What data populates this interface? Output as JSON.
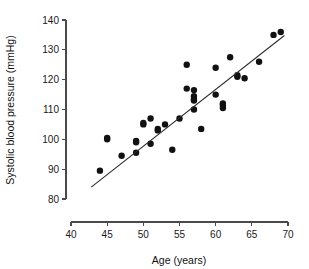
{
  "chart_data": {
    "type": "scatter",
    "title": "",
    "xlabel": "Age (years)",
    "ylabel": "Systolic blood pressure (mmHg)",
    "xlim": [
      40,
      70
    ],
    "ylim": [
      80,
      140
    ],
    "xticks": [
      40,
      45,
      50,
      55,
      60,
      65,
      70
    ],
    "yticks": [
      80,
      90,
      100,
      110,
      120,
      130,
      140
    ],
    "grid": false,
    "legend": null,
    "x": [
      44,
      45,
      45,
      47,
      49,
      49,
      49,
      50,
      50,
      51,
      51,
      52,
      52,
      53,
      54,
      55,
      56,
      56,
      57,
      57,
      57,
      57,
      57,
      58,
      60,
      60,
      61,
      61,
      61,
      62,
      63,
      63,
      64,
      66,
      68,
      69
    ],
    "y": [
      89.5,
      100.5,
      100,
      94.5,
      99.5,
      99,
      95.5,
      105,
      105.5,
      107,
      98.5,
      103.5,
      103,
      105,
      96.5,
      107,
      117,
      125,
      116.5,
      114.5,
      113.5,
      113,
      110,
      103.5,
      124,
      115,
      112,
      111.5,
      110.5,
      127.5,
      121.5,
      121,
      120.5,
      126,
      135,
      136
    ],
    "points": [
      {
        "x": 44,
        "y": 89.5
      },
      {
        "x": 45,
        "y": 100.5
      },
      {
        "x": 45,
        "y": 100.0
      },
      {
        "x": 47,
        "y": 94.5
      },
      {
        "x": 49,
        "y": 99.5
      },
      {
        "x": 49,
        "y": 99.0
      },
      {
        "x": 49,
        "y": 95.5
      },
      {
        "x": 50,
        "y": 105.0
      },
      {
        "x": 50,
        "y": 105.5
      },
      {
        "x": 51,
        "y": 107.0
      },
      {
        "x": 51,
        "y": 98.5
      },
      {
        "x": 52,
        "y": 103.5
      },
      {
        "x": 52,
        "y": 103.0
      },
      {
        "x": 53,
        "y": 105.0
      },
      {
        "x": 54,
        "y": 96.5
      },
      {
        "x": 55,
        "y": 107.0
      },
      {
        "x": 56,
        "y": 117.0
      },
      {
        "x": 56,
        "y": 125.0
      },
      {
        "x": 57,
        "y": 116.5
      },
      {
        "x": 57,
        "y": 114.5
      },
      {
        "x": 57,
        "y": 113.5
      },
      {
        "x": 57,
        "y": 113.0
      },
      {
        "x": 57,
        "y": 110.0
      },
      {
        "x": 58,
        "y": 103.5
      },
      {
        "x": 60,
        "y": 124.0
      },
      {
        "x": 60,
        "y": 115.0
      },
      {
        "x": 61,
        "y": 112.0
      },
      {
        "x": 61,
        "y": 111.5
      },
      {
        "x": 61,
        "y": 110.5
      },
      {
        "x": 62,
        "y": 127.5
      },
      {
        "x": 63,
        "y": 121.5
      },
      {
        "x": 63,
        "y": 121.0
      },
      {
        "x": 64,
        "y": 120.5
      },
      {
        "x": 66,
        "y": 126.0
      },
      {
        "x": 68,
        "y": 135.0
      },
      {
        "x": 69,
        "y": 136.0
      }
    ],
    "fit_line": {
      "type": "linear-regression",
      "x_start": 42.8,
      "y_start": 84.0,
      "x_end": 69.5,
      "y_end": 134.8
    },
    "marker": {
      "shape": "circle",
      "color": "#111111",
      "size": 4.2
    },
    "line_color": "#2a2a2a"
  },
  "axes": {
    "x_title": "Age (years)",
    "y_title": "Systolic blood pressure (mmHg)",
    "x_tick_labels": [
      "40",
      "45",
      "50",
      "55",
      "60",
      "65",
      "70"
    ],
    "y_tick_labels": [
      "80",
      "90",
      "100",
      "110",
      "120",
      "130",
      "140"
    ]
  }
}
